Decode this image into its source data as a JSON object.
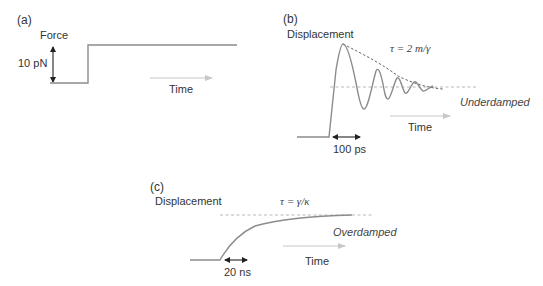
{
  "figure": {
    "panels": [
      {
        "id": "a",
        "label": "(a)",
        "y_label": "Force",
        "scale_label": "10 pN",
        "time_label": "Time"
      },
      {
        "id": "b",
        "label": "(b)",
        "y_label": "Displacement",
        "tau_label": "τ = 2 m/γ",
        "regime_label": "Underdamped",
        "scale_label": "100 ps",
        "time_label": "Time"
      },
      {
        "id": "c",
        "label": "(c)",
        "y_label": "Displacement",
        "tau_label": "τ = γ/κ",
        "regime_label": "Overdamped",
        "scale_label": "20 ns",
        "time_label": "Time"
      }
    ],
    "colors": {
      "curve": "#8c8c8c",
      "dashed_reference": "#b0b0b0",
      "envelope": "#666666",
      "time_arrow": "#c8c8c8",
      "scale_arrow": "#222222",
      "text": "#333333"
    }
  }
}
